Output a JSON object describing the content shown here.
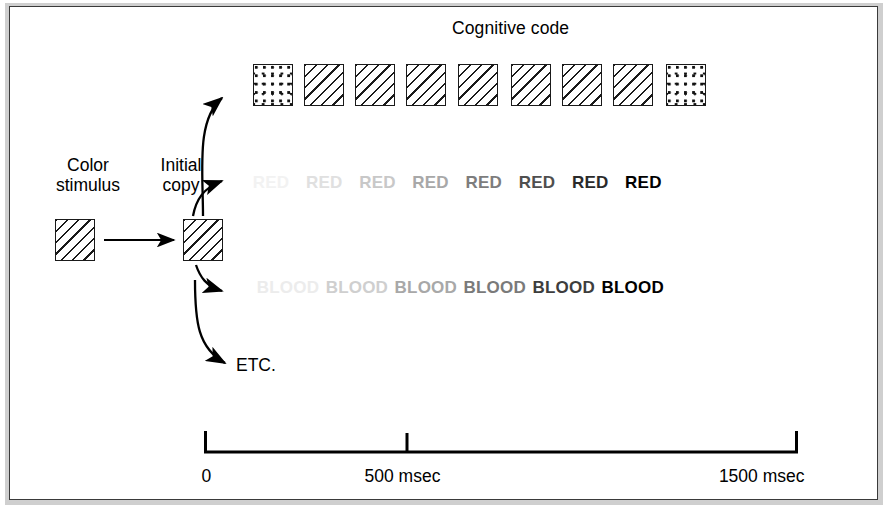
{
  "figure": {
    "title": "Cognitive code",
    "labels": {
      "color_stimulus_line1": "Color",
      "color_stimulus_line2": "stimulus",
      "initial_copy_line1": "Initial",
      "initial_copy_line2": "copy",
      "etc": "ETC."
    }
  },
  "stimulus_swatch": {
    "pattern": "hatch"
  },
  "initial_copy_swatch": {
    "pattern": "hatch"
  },
  "chart_data": {
    "type": "diagram-timeline",
    "title": "Cognitive code",
    "xlabel": "",
    "ylabel": "",
    "xlim": [
      0,
      1500
    ],
    "x_unit": "msec",
    "grid": false,
    "axis_ticks": [
      {
        "value": 0,
        "label": "0"
      },
      {
        "value": 500,
        "label": "500 msec"
      },
      {
        "value": 1500,
        "label": "1500 msec"
      }
    ],
    "series": [
      {
        "name": "color-swatch-row",
        "kind": "swatch",
        "count": 9,
        "items": [
          {
            "pattern": "dots",
            "x_msec": 120
          },
          {
            "pattern": "hatch",
            "x_msec": 250
          },
          {
            "pattern": "hatch",
            "x_msec": 380
          },
          {
            "pattern": "hatch",
            "x_msec": 510
          },
          {
            "pattern": "hatch",
            "x_msec": 640
          },
          {
            "pattern": "hatch",
            "x_msec": 775
          },
          {
            "pattern": "hatch",
            "x_msec": 905
          },
          {
            "pattern": "hatch",
            "x_msec": 1035
          },
          {
            "pattern": "dots",
            "x_msec": 1170
          }
        ]
      },
      {
        "name": "red-word-row",
        "kind": "word",
        "text": "RED",
        "count": 8,
        "items": [
          {
            "text": "RED",
            "color": "#f2f2f2",
            "x_msec": 120
          },
          {
            "text": "RED",
            "color": "#e0e0e0",
            "x_msec": 255
          },
          {
            "text": "RED",
            "color": "#c8c8c8",
            "x_msec": 390
          },
          {
            "text": "RED",
            "color": "#a8a8a8",
            "x_msec": 525
          },
          {
            "text": "RED",
            "color": "#7d7d7d",
            "x_msec": 660
          },
          {
            "text": "RED",
            "color": "#4f4f4f",
            "x_msec": 795
          },
          {
            "text": "RED",
            "color": "#2a2a2a",
            "x_msec": 930
          },
          {
            "text": "RED",
            "color": "#000000",
            "x_msec": 1065
          }
        ]
      },
      {
        "name": "blood-word-row",
        "kind": "word",
        "text": "BLOOD",
        "count": 6,
        "items": [
          {
            "text": "BLOOD",
            "color": "#ececec",
            "x_msec": 130
          },
          {
            "text": "BLOOD",
            "color": "#cfcfcf",
            "x_msec": 305
          },
          {
            "text": "BLOOD",
            "color": "#a8a8a8",
            "x_msec": 480
          },
          {
            "text": "BLOOD",
            "color": "#7a7a7a",
            "x_msec": 655
          },
          {
            "text": "BLOOD",
            "color": "#3d3d3d",
            "x_msec": 830
          },
          {
            "text": "BLOOD",
            "color": "#000000",
            "x_msec": 1005
          }
        ]
      },
      {
        "name": "etc-row",
        "kind": "text",
        "text": "ETC.",
        "count": 1
      }
    ]
  }
}
